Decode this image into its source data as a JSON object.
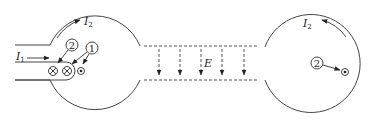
{
  "diagram": {
    "left_chamber": {
      "current_in_label": "I",
      "current_in_sub": "1",
      "current_loop_label": "I",
      "current_loop_sub": "2",
      "marker_1": "1",
      "marker_2": "2",
      "symbols": [
        "into-page",
        "into-page",
        "out-of-page"
      ]
    },
    "field_region": {
      "label": "E",
      "arrow_count": 5,
      "direction": "down"
    },
    "right_chamber": {
      "current_loop_label": "I",
      "current_loop_sub": "2",
      "marker_2": "2",
      "symbols": [
        "out-of-page"
      ]
    },
    "colors": {
      "stroke": "#444444",
      "background": "#ffffff"
    }
  }
}
